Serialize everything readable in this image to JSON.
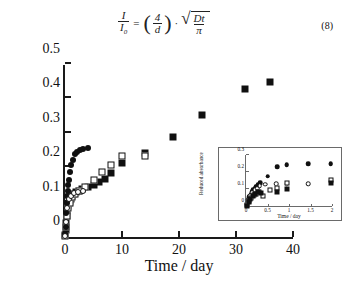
{
  "equation": {
    "numerator": "I",
    "denominator_base": "I",
    "denominator_sub": "0",
    "equals": "=",
    "paren_open": "(",
    "paren_close": ")",
    "factor_num": "4",
    "factor_den": "d",
    "dot": "·",
    "radical_sign": "√",
    "radicand_num": "Dt",
    "radicand_den": "π",
    "number": "(8)"
  },
  "chart_data": {
    "type": "scatter",
    "title": "",
    "xlabel": "Time / day",
    "ylabel": "Reduced absorbance",
    "xlim": [
      0,
      40
    ],
    "ylim": [
      0,
      0.5
    ],
    "xticks": [
      "0",
      "10",
      "20",
      "30",
      "40"
    ],
    "xtick_values": [
      0,
      10,
      20,
      30,
      40
    ],
    "yticks": [
      "0",
      "0.1",
      "0.2",
      "0.3",
      "0.4",
      "0.5"
    ],
    "ytick_values": [
      0,
      0.1,
      0.2,
      0.3,
      0.4,
      0.5
    ],
    "grid": false,
    "legend": "none",
    "series": [
      {
        "name": "filled-square",
        "marker": "filled-square",
        "x": [
          0.05,
          0.1,
          0.2,
          0.3,
          0.4,
          0.5,
          0.7,
          0.9,
          1.0,
          1.2,
          1.5,
          2.0,
          2.5,
          3.0,
          4.0,
          5.0,
          6.0,
          7.0,
          8.0,
          10.0,
          14.0,
          19.0,
          24.0,
          31.5,
          36.0
        ],
        "y": [
          0.005,
          0.02,
          0.04,
          0.06,
          0.075,
          0.09,
          0.1,
          0.105,
          0.11,
          0.12,
          0.125,
          0.13,
          0.135,
          0.14,
          0.145,
          0.15,
          0.16,
          0.17,
          0.185,
          0.215,
          0.245,
          0.29,
          0.355,
          0.43,
          0.45
        ]
      },
      {
        "name": "open-square",
        "marker": "open-square",
        "x": [
          0.05,
          0.15,
          0.3,
          0.5,
          0.8,
          1.2,
          1.8,
          2.5,
          3.5,
          5.0,
          6.5,
          8.0,
          10.0,
          14.0
        ],
        "y": [
          0.003,
          0.03,
          0.06,
          0.085,
          0.1,
          0.115,
          0.125,
          0.135,
          0.145,
          0.165,
          0.19,
          0.21,
          0.235,
          0.235
        ]
      },
      {
        "name": "filled-circle",
        "marker": "filled-circle",
        "x": [
          0.05,
          0.1,
          0.2,
          0.3,
          0.4,
          0.5,
          0.6,
          0.7,
          0.9,
          1.1,
          1.4,
          1.7,
          2.1,
          2.6,
          3.2,
          4.0
        ],
        "y": [
          0.008,
          0.03,
          0.07,
          0.1,
          0.12,
          0.135,
          0.15,
          0.165,
          0.19,
          0.21,
          0.225,
          0.24,
          0.248,
          0.252,
          0.255,
          0.258
        ]
      },
      {
        "name": "open-circle",
        "marker": "open-circle",
        "x": [
          0.05,
          0.2,
          0.4,
          0.7,
          1.0,
          1.5,
          2.2,
          3.2
        ],
        "y": [
          0.004,
          0.045,
          0.085,
          0.11,
          0.12,
          0.128,
          0.132,
          0.135
        ]
      }
    ],
    "inset": {
      "type": "scatter",
      "xlabel": "Time / day",
      "ylabel": "Reduced absorbance",
      "xlim": [
        0,
        2
      ],
      "ylim": [
        0,
        0.3
      ],
      "xticks": [
        "0",
        "0.5",
        "1",
        "1.5",
        "2"
      ],
      "xtick_values": [
        0,
        0.5,
        1,
        1.5,
        2
      ],
      "yticks": [
        "0",
        "0.1",
        "0.2",
        "0.3"
      ],
      "ytick_values": [
        0,
        0.1,
        0.2,
        0.3
      ],
      "grid": false,
      "series": [
        {
          "name": "filled-circle",
          "marker": "filled-circle",
          "x": [
            0.02,
            0.05,
            0.08,
            0.11,
            0.14,
            0.17,
            0.2,
            0.24,
            0.28,
            0.33,
            0.5,
            0.72,
            0.95,
            1.45,
            1.97
          ],
          "y": [
            0.012,
            0.035,
            0.055,
            0.07,
            0.085,
            0.095,
            0.105,
            0.115,
            0.125,
            0.135,
            0.175,
            0.232,
            0.244,
            0.248,
            0.25
          ]
        },
        {
          "name": "open-circle",
          "marker": "open-circle",
          "x": [
            0.02,
            0.06,
            0.1,
            0.15,
            0.2,
            0.26,
            0.32,
            0.45,
            0.7,
            0.95,
            1.45
          ],
          "y": [
            0.008,
            0.04,
            0.06,
            0.08,
            0.095,
            0.105,
            0.12,
            0.128,
            0.13,
            0.132,
            0.131
          ]
        },
        {
          "name": "open-square",
          "marker": "open-square",
          "x": [
            0.02,
            0.07,
            0.12,
            0.18,
            0.24,
            0.3,
            0.4,
            0.55,
            0.72,
            0.95,
            1.97
          ],
          "y": [
            0.004,
            0.028,
            0.05,
            0.062,
            0.073,
            0.085,
            0.06,
            0.095,
            0.108,
            0.135,
            0.155
          ]
        },
        {
          "name": "filled-square",
          "marker": "filled-square",
          "x": [
            0.02,
            0.06,
            0.1,
            0.16,
            0.22,
            0.28,
            0.36,
            0.72,
            0.95,
            1.97
          ],
          "y": [
            0.002,
            0.022,
            0.042,
            0.058,
            0.07,
            0.08,
            0.075,
            0.085,
            0.098,
            0.138
          ]
        }
      ]
    }
  }
}
